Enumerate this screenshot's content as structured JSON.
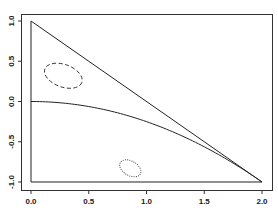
{
  "chart_data": {
    "type": "line",
    "title": "",
    "xlabel": "",
    "ylabel": "",
    "xlim": [
      0.0,
      2.0
    ],
    "ylim": [
      -1.0,
      1.0
    ],
    "grid": false,
    "legend": null,
    "x_ticks": [
      "0.0",
      "0.5",
      "1.0",
      "1.5",
      "2.0"
    ],
    "y_ticks": [
      "-1.0",
      "-0.5",
      "0.0",
      "0.5",
      "1.0"
    ],
    "series": [
      {
        "name": "triangle-boundary",
        "style": "solid",
        "points": [
          [
            0.0,
            1.0
          ],
          [
            2.0,
            -1.0
          ],
          [
            0.0,
            -1.0
          ],
          [
            0.0,
            1.0
          ]
        ]
      },
      {
        "name": "curve",
        "style": "solid",
        "points": [
          [
            0.0,
            0.0
          ],
          [
            0.25,
            -0.016
          ],
          [
            0.5,
            -0.0625
          ],
          [
            0.75,
            -0.14
          ],
          [
            1.0,
            -0.25
          ],
          [
            1.25,
            -0.39
          ],
          [
            1.5,
            -0.5625
          ],
          [
            1.75,
            -0.766
          ],
          [
            2.0,
            -1.0
          ]
        ]
      },
      {
        "name": "ellipse-dashed",
        "style": "dashed",
        "shape": "ellipse",
        "center": [
          0.28,
          0.32
        ],
        "rx_data": 0.17,
        "ry_data": 0.14,
        "rotation_deg": 20
      },
      {
        "name": "ellipse-dotted",
        "style": "dotted",
        "shape": "ellipse",
        "center": [
          0.86,
          -0.83
        ],
        "rx_data": 0.1,
        "ry_data": 0.09,
        "rotation_deg": 30
      }
    ]
  }
}
